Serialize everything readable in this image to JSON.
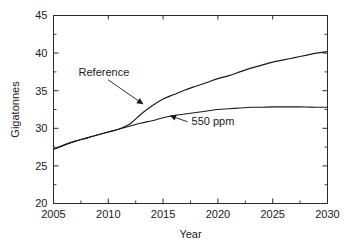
{
  "chart_data": {
    "type": "line",
    "title": "",
    "xlabel": "Year",
    "ylabel": "Gigatonnes",
    "xlim": [
      2005,
      2030
    ],
    "ylim": [
      20,
      45
    ],
    "grid": false,
    "legend_position": "inline-annotations",
    "x_ticks": [
      2005,
      2010,
      2015,
      2020,
      2025,
      2030
    ],
    "x_tick_labels": [
      "2005",
      "2010",
      "2015",
      "2020",
      "2025",
      "2030"
    ],
    "x_minor_ticks": [
      2007.5,
      2012.5,
      2017.5,
      2022.5,
      2027.5
    ],
    "y_ticks": [
      20,
      25,
      30,
      35,
      40,
      45
    ],
    "y_tick_labels": [
      "20",
      "25",
      "30",
      "35",
      "40",
      "45"
    ],
    "y_minor_ticks": [
      22.5,
      27.5,
      32.5,
      37.5,
      42.5
    ],
    "x": [
      2005,
      2006,
      2007,
      2008,
      2009,
      2010,
      2011,
      2012,
      2013,
      2014,
      2015,
      2016,
      2017,
      2018,
      2019,
      2020,
      2021,
      2022,
      2023,
      2024,
      2025,
      2026,
      2027,
      2028,
      2029,
      2030
    ],
    "series": [
      {
        "name": "Reference",
        "color": "#1a1a1a",
        "values": [
          27.2,
          27.8,
          28.3,
          28.7,
          29.1,
          29.5,
          29.9,
          30.6,
          31.9,
          33.0,
          33.9,
          34.5,
          35.1,
          35.6,
          36.1,
          36.6,
          37.0,
          37.5,
          38.0,
          38.4,
          38.8,
          39.1,
          39.4,
          39.7,
          40.0,
          40.2
        ]
      },
      {
        "name": "550 ppm",
        "color": "#1a1a1a",
        "values": [
          27.2,
          27.8,
          28.3,
          28.7,
          29.1,
          29.5,
          29.9,
          30.3,
          30.7,
          31.0,
          31.4,
          31.7,
          31.9,
          32.1,
          32.3,
          32.5,
          32.6,
          32.7,
          32.8,
          32.8,
          32.85,
          32.85,
          32.85,
          32.83,
          32.8,
          32.8
        ]
      }
    ],
    "annotations": [
      {
        "id": "reference-annotation",
        "text": "Reference",
        "label_x": 2009.6,
        "label_y": 37.0,
        "point_x": 2013.2,
        "point_y": 33.2
      },
      {
        "id": "ppm-annotation",
        "text": "550 ppm",
        "label_x": 2017.6,
        "label_y": 30.4,
        "point_x": 2015.6,
        "point_y": 31.7
      }
    ]
  }
}
